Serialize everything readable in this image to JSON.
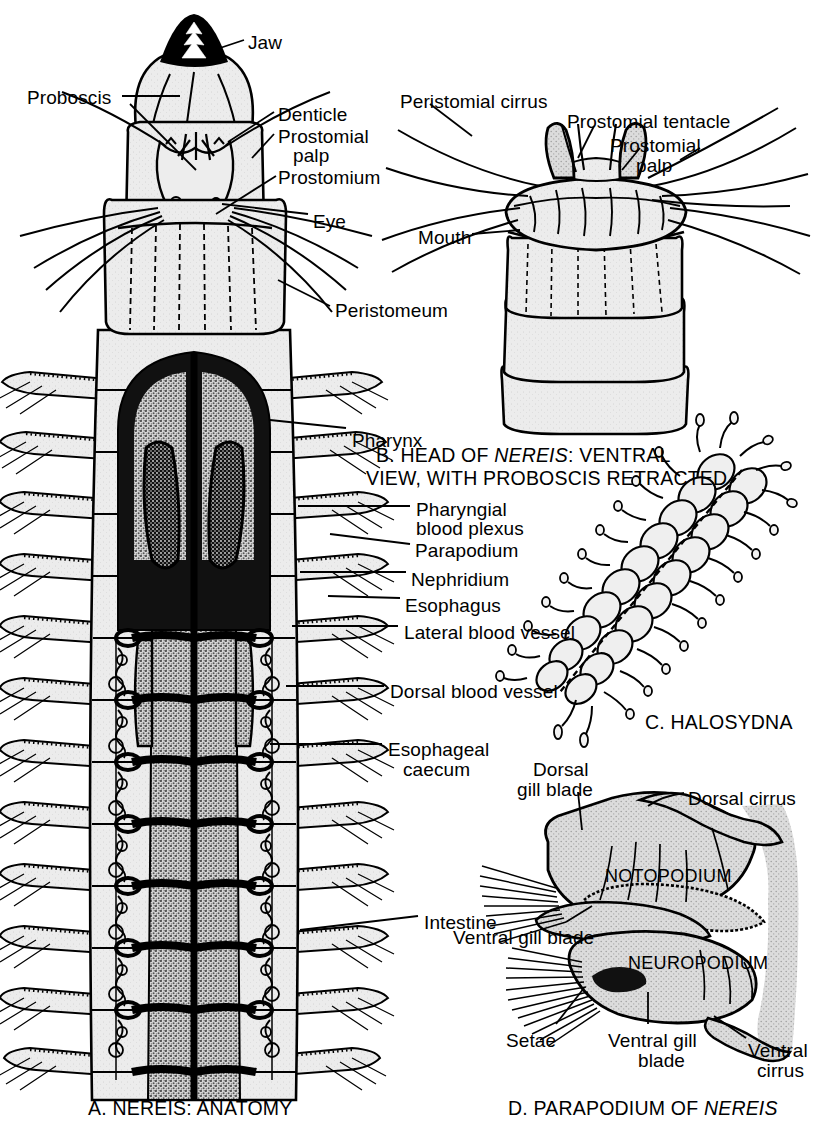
{
  "figure": {
    "title_hidden": "Polychaete anatomy plate",
    "background": "#ffffff",
    "ink": "#000000",
    "body_fill": "#e8e8e8",
    "gut_fill": "#9a9a9a",
    "plexus_fill": "#141414"
  },
  "panels": {
    "A": {
      "caption": "A. NEREIS: ANATOMY",
      "caption_italic_part": "",
      "labels_left": [
        {
          "id": "proboscis",
          "text": "Proboscis",
          "x": 27,
          "y": 88
        }
      ],
      "labels_top_right": [
        {
          "id": "jaw",
          "text": "Jaw",
          "x": 248,
          "y": 33
        },
        {
          "id": "denticle",
          "text": "Denticle",
          "x": 278,
          "y": 105
        },
        {
          "id": "prostomial-palp-1",
          "text": "Prostomial",
          "x": 278,
          "y": 127
        },
        {
          "id": "prostomial-palp-2",
          "text": "palp",
          "x": 293,
          "y": 146
        },
        {
          "id": "prostomium",
          "text": "Prostomium",
          "x": 278,
          "y": 168
        },
        {
          "id": "eye",
          "text": "Eye",
          "x": 313,
          "y": 212
        },
        {
          "id": "peristomeum",
          "text": "Peristomeum",
          "x": 335,
          "y": 301
        }
      ],
      "labels_right": [
        {
          "id": "pharynx",
          "text": "Pharynx",
          "x": 352,
          "y": 431
        },
        {
          "id": "pharyngial-1",
          "text": "Pharyngial",
          "x": 416,
          "y": 500
        },
        {
          "id": "pharyngial-2",
          "text": "blood plexus",
          "x": 416,
          "y": 519
        },
        {
          "id": "parapodium",
          "text": "Parapodium",
          "x": 415,
          "y": 541
        },
        {
          "id": "nephridium",
          "text": "Nephridium",
          "x": 411,
          "y": 570
        },
        {
          "id": "esophagus",
          "text": "Esophagus",
          "x": 405,
          "y": 596
        },
        {
          "id": "lateral-blood-vessel",
          "text": "Lateral  blood  vessel",
          "x": 404,
          "y": 623
        },
        {
          "id": "dorsal-blood-vessel",
          "text": "Dorsal  blood  vessel",
          "x": 390,
          "y": 682
        },
        {
          "id": "esophageal-caecum-1",
          "text": "Esophageal",
          "x": 388,
          "y": 740
        },
        {
          "id": "esophageal-caecum-2",
          "text": "caecum",
          "x": 403,
          "y": 760
        },
        {
          "id": "intestine",
          "text": "Intestine",
          "x": 424,
          "y": 913
        }
      ]
    },
    "B": {
      "caption_line1_prefix": "B. HEAD OF ",
      "caption_line1_italic": "NEREIS",
      "caption_line1_suffix": ": VENTRAL",
      "caption_line2": "VIEW, WITH PROBOSCIS RETRACTED",
      "labels": [
        {
          "id": "peristomial-cirrus",
          "text": "Peristomial cirrus",
          "x": 400,
          "y": 92
        },
        {
          "id": "prostomial-tentacle",
          "text": "Prostomial tentacle",
          "x": 567,
          "y": 112
        },
        {
          "id": "prostomial-palp-b1",
          "text": "Prostomial",
          "x": 610,
          "y": 136
        },
        {
          "id": "prostomial-palp-b2",
          "text": "palp",
          "x": 636,
          "y": 156
        },
        {
          "id": "mouth",
          "text": "Mouth",
          "x": 418,
          "y": 228
        }
      ]
    },
    "C": {
      "caption": "C. HALOSYDNA"
    },
    "D": {
      "caption_prefix": "D. PARAPODIUM OF ",
      "caption_italic": "NEREIS",
      "inner_labels": [
        {
          "id": "notopodium",
          "text": "NOTOPODIUM",
          "x": 605,
          "y": 866
        },
        {
          "id": "neuropodium",
          "text": "NEUROPODIUM",
          "x": 628,
          "y": 953
        }
      ],
      "labels": [
        {
          "id": "dorsal-gill-blade-1",
          "text": "Dorsal",
          "x": 533,
          "y": 760
        },
        {
          "id": "dorsal-gill-blade-2",
          "text": "gill blade",
          "x": 517,
          "y": 780
        },
        {
          "id": "dorsal-cirrus",
          "text": "Dorsal cirrus",
          "x": 688,
          "y": 789
        },
        {
          "id": "ventral-gill-blade-upper",
          "text": "Ventral gill blade",
          "x": 453,
          "y": 928
        },
        {
          "id": "setae",
          "text": "Setae",
          "x": 506,
          "y": 1031
        },
        {
          "id": "ventral-gill-blade-1",
          "text": "Ventral gill",
          "x": 608,
          "y": 1031
        },
        {
          "id": "ventral-gill-blade-2",
          "text": "blade",
          "x": 638,
          "y": 1051
        },
        {
          "id": "ventral-cirrus-1",
          "text": "Ventral",
          "x": 748,
          "y": 1041
        },
        {
          "id": "ventral-cirrus-2",
          "text": "cirrus",
          "x": 757,
          "y": 1061
        }
      ]
    }
  }
}
